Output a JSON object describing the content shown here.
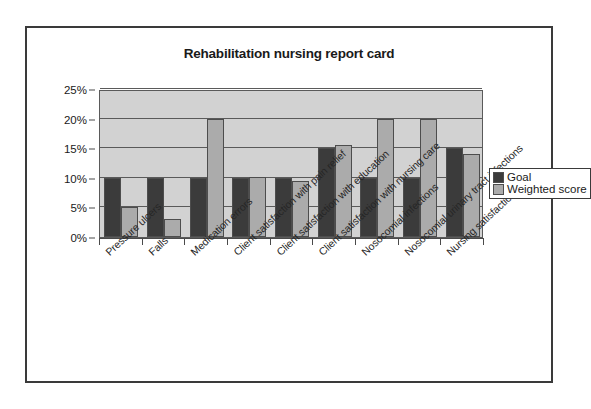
{
  "chart_data": {
    "type": "bar",
    "title": "Rehabilitation nursing report card",
    "xlabel": "",
    "ylabel": "",
    "ylim": [
      0,
      25
    ],
    "ytick_labels": [
      "0%",
      "5%",
      "10%",
      "15%",
      "20%",
      "25%"
    ],
    "ytick_values": [
      0,
      5,
      10,
      15,
      20,
      25
    ],
    "grid": true,
    "legend_position": "right",
    "categories": [
      "Pressure ulcers",
      "Falls",
      "Medication errors",
      "Client satisfaction with pain relief",
      "Client satisfaction with education",
      "Client satisfaction with nursing care",
      "Nosocomial infections",
      "Nosocomial urinary tract infections",
      "Nursing satisfaction"
    ],
    "series": [
      {
        "name": "Goal",
        "color": "#3b3b3b",
        "values": [
          10,
          10,
          10,
          10,
          10,
          15,
          10,
          10,
          15
        ]
      },
      {
        "name": "Weighted score",
        "color": "#ababab",
        "values": [
          5,
          3,
          20,
          10.2,
          9.5,
          15.5,
          20,
          20,
          14
        ]
      }
    ]
  },
  "legend": {
    "items": [
      {
        "label": "Goal",
        "swatch": "goal"
      },
      {
        "label": "Weighted score",
        "swatch": "weighted"
      }
    ]
  }
}
